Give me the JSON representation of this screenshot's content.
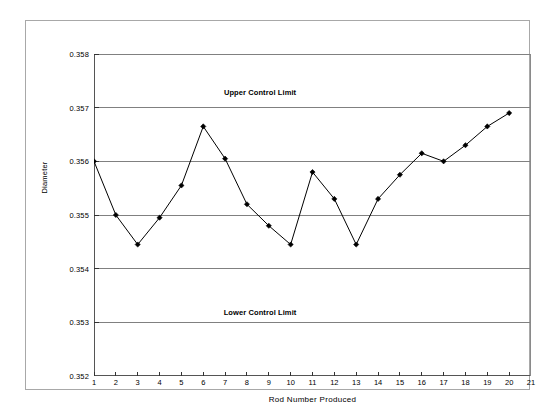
{
  "chart_data": {
    "type": "line",
    "title": "",
    "xlabel": "Rod Number Produced",
    "ylabel": "Diameter",
    "xlim": [
      1,
      21
    ],
    "ylim": [
      0.352,
      0.358
    ],
    "xticks": [
      1,
      2,
      3,
      4,
      5,
      6,
      7,
      8,
      9,
      10,
      11,
      12,
      13,
      14,
      15,
      16,
      17,
      18,
      19,
      20,
      21
    ],
    "xtick_labels": [
      "1",
      "2",
      "3",
      "4",
      "5",
      "6",
      "7",
      "8",
      "9",
      "10",
      "11",
      "12",
      "13",
      "14",
      "15",
      "16",
      "17",
      "18",
      "19",
      "20",
      "21"
    ],
    "yticks": [
      0.352,
      0.353,
      0.354,
      0.355,
      0.356,
      0.357,
      0.358
    ],
    "ytick_labels": [
      "0.352",
      "0.353",
      "0.354",
      "0.355",
      "0.356",
      "0.357",
      "0.358"
    ],
    "grid": {
      "horizontal": true,
      "vertical": false
    },
    "legend": null,
    "x": [
      1,
      2,
      3,
      4,
      5,
      6,
      7,
      8,
      9,
      10,
      11,
      12,
      13,
      14,
      15,
      16,
      17,
      18,
      19,
      20
    ],
    "series": [
      {
        "name": "Diameter",
        "marker": "diamond",
        "color": "#000000",
        "values": [
          0.356,
          0.355,
          0.35445,
          0.35495,
          0.35555,
          0.35665,
          0.35605,
          0.3552,
          0.3548,
          0.35445,
          0.3558,
          0.3553,
          0.35445,
          0.3553,
          0.35575,
          0.35615,
          0.356,
          0.3563,
          0.35665,
          0.3569
        ]
      }
    ],
    "annotations": [
      {
        "text": "Upper Control Limit",
        "x": 8.6,
        "y": 0.3573
      },
      {
        "text": "Lower Control Limit",
        "x": 8.6,
        "y": 0.3532
      }
    ]
  }
}
